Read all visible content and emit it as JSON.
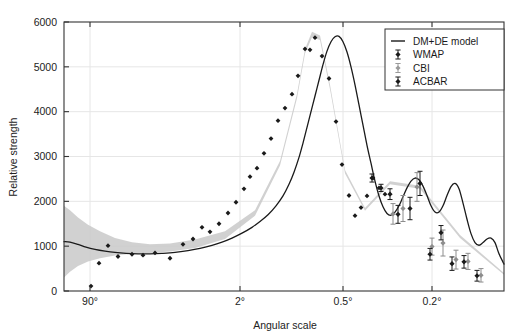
{
  "chart_data": {
    "type": "line",
    "title": "",
    "xlabel": "Angular scale",
    "ylabel": "Relative strength",
    "grid": true,
    "legend_position": "top-right",
    "ylim": [
      0,
      6000
    ],
    "yticks": [
      0,
      1000,
      2000,
      3000,
      4000,
      5000,
      6000
    ],
    "ytick_labels": [
      "0",
      "1000",
      "2000",
      "3000",
      "4000",
      "5000",
      "6000"
    ],
    "xtick_labels": [
      "90°",
      "2°",
      "0.5°",
      "0.2°"
    ],
    "xtick_positions_px": [
      90,
      240,
      343,
      432
    ],
    "x_axis_note": "multipole / inverse angular scale, non-linear",
    "legend": [
      {
        "label": "DM+DE model",
        "marker": "line",
        "color": "#1a1a1a"
      },
      {
        "label": "WMAP",
        "marker": "errorbar",
        "color": "#1a1a1a"
      },
      {
        "label": "CBI",
        "marker": "errorbar",
        "color": "#9a9a9a"
      },
      {
        "label": "ACBAR",
        "marker": "errorbar",
        "color": "#1a1a1a"
      }
    ],
    "band": {
      "name": "cosmic variance",
      "color": "#c9c9c9",
      "x": [
        64,
        70,
        78,
        88,
        100,
        115,
        132,
        150,
        170,
        195,
        225,
        255,
        280,
        297,
        305,
        312,
        320,
        330,
        345,
        365,
        390,
        420,
        460,
        504
      ],
      "upper": [
        1900,
        1800,
        1640,
        1480,
        1330,
        1180,
        1090,
        1045,
        1060,
        1150,
        1330,
        1800,
        2900,
        4400,
        5400,
        5780,
        5700,
        4600,
        2700,
        1850,
        2450,
        2350,
        1250,
        400
      ],
      "lower": [
        300,
        430,
        560,
        660,
        730,
        790,
        830,
        850,
        880,
        960,
        1160,
        1680,
        2800,
        4300,
        5300,
        5660,
        5600,
        4500,
        2620,
        1790,
        2380,
        2280,
        1180,
        360
      ]
    },
    "series": [
      {
        "name": "DM+DE model",
        "type": "line",
        "color": "#1a1a1a",
        "points": [
          [
            64,
            1100
          ],
          [
            70,
            1090
          ],
          [
            78,
            1040
          ],
          [
            86,
            980
          ],
          [
            95,
            930
          ],
          [
            105,
            890
          ],
          [
            115,
            860
          ],
          [
            126,
            840
          ],
          [
            138,
            830
          ],
          [
            150,
            830
          ],
          [
            162,
            840
          ],
          [
            175,
            860
          ],
          [
            188,
            900
          ],
          [
            200,
            950
          ],
          [
            212,
            1020
          ],
          [
            222,
            1090
          ],
          [
            232,
            1180
          ],
          [
            242,
            1290
          ],
          [
            252,
            1420
          ],
          [
            260,
            1550
          ],
          [
            268,
            1700
          ],
          [
            276,
            1900
          ],
          [
            283,
            2120
          ],
          [
            289,
            2380
          ],
          [
            294,
            2650
          ],
          [
            299,
            2980
          ],
          [
            303,
            3300
          ],
          [
            307,
            3650
          ],
          [
            311,
            4000
          ],
          [
            315,
            4350
          ],
          [
            319,
            4700
          ],
          [
            323,
            5050
          ],
          [
            327,
            5350
          ],
          [
            331,
            5560
          ],
          [
            335,
            5670
          ],
          [
            339,
            5680
          ],
          [
            343,
            5560
          ],
          [
            347,
            5330
          ],
          [
            351,
            5000
          ],
          [
            355,
            4600
          ],
          [
            359,
            4150
          ],
          [
            363,
            3700
          ],
          [
            367,
            3250
          ],
          [
            371,
            2850
          ],
          [
            375,
            2450
          ],
          [
            379,
            2120
          ],
          [
            383,
            1880
          ],
          [
            387,
            1730
          ],
          [
            391,
            1690
          ],
          [
            395,
            1760
          ],
          [
            399,
            1900
          ],
          [
            403,
            2100
          ],
          [
            407,
            2300
          ],
          [
            411,
            2450
          ],
          [
            415,
            2520
          ],
          [
            419,
            2480
          ],
          [
            423,
            2340
          ],
          [
            427,
            2130
          ],
          [
            431,
            1900
          ],
          [
            435,
            1760
          ],
          [
            439,
            1760
          ],
          [
            443,
            1900
          ],
          [
            447,
            2130
          ],
          [
            451,
            2330
          ],
          [
            455,
            2400
          ],
          [
            459,
            2280
          ],
          [
            463,
            1960
          ],
          [
            467,
            1600
          ],
          [
            471,
            1280
          ],
          [
            475,
            1080
          ],
          [
            479,
            1020
          ],
          [
            483,
            1080
          ],
          [
            487,
            1160
          ],
          [
            491,
            1180
          ],
          [
            495,
            1080
          ],
          [
            499,
            830
          ],
          [
            504,
            600
          ]
        ]
      },
      {
        "name": "WMAP",
        "type": "scatter",
        "color": "#1a1a1a",
        "marker": "diamond",
        "points": [
          [
            91,
            110
          ],
          [
            99,
            620
          ],
          [
            108,
            1010
          ],
          [
            118,
            770
          ],
          [
            132,
            820
          ],
          [
            143,
            800
          ],
          [
            155,
            850
          ],
          [
            170,
            730
          ],
          [
            183,
            1040
          ],
          [
            193,
            1160
          ],
          [
            202,
            1420
          ],
          [
            210,
            1320
          ],
          [
            219,
            1500
          ],
          [
            228,
            1740
          ],
          [
            236,
            1980
          ],
          [
            244,
            2280
          ],
          [
            250,
            2550
          ],
          [
            257,
            2740
          ],
          [
            264,
            3070
          ],
          [
            271,
            3400
          ],
          [
            278,
            3800
          ],
          [
            285,
            4080
          ],
          [
            292,
            4390
          ],
          [
            298,
            4800
          ],
          [
            305,
            5400
          ],
          [
            310,
            5380
          ],
          [
            315,
            5650
          ],
          [
            322,
            5240
          ],
          [
            329,
            4740
          ],
          [
            336,
            3780
          ],
          [
            342,
            2820
          ],
          [
            349,
            2130
          ],
          [
            355,
            1680
          ],
          [
            361,
            1860
          ],
          [
            367,
            2120
          ],
          [
            373,
            2520
          ],
          [
            379,
            2300
          ],
          [
            385,
            2160
          ]
        ]
      },
      {
        "name": "CBI",
        "type": "errorbar",
        "color": "#8d8d8d",
        "points": [
          [
            393,
            1720,
            230
          ],
          [
            403,
            1840,
            290
          ],
          [
            417,
            2320,
            320
          ],
          [
            432,
            990,
            190
          ],
          [
            443,
            1070,
            290
          ],
          [
            456,
            700,
            210
          ],
          [
            468,
            660,
            180
          ],
          [
            481,
            350,
            150
          ]
        ]
      },
      {
        "name": "ACBAR",
        "type": "errorbar",
        "color": "#1a1a1a",
        "points": [
          [
            372,
            2520,
            90
          ],
          [
            381,
            2300,
            80
          ],
          [
            390,
            2160,
            120
          ],
          [
            398,
            1710,
            200
          ],
          [
            410,
            1840,
            250
          ],
          [
            420,
            2400,
            270
          ],
          [
            430,
            820,
            130
          ],
          [
            441,
            1300,
            160
          ],
          [
            452,
            610,
            150
          ],
          [
            464,
            650,
            140
          ],
          [
            477,
            340,
            120
          ]
        ]
      }
    ],
    "peaks": [
      {
        "name": "first acoustic peak",
        "value": 5680
      },
      {
        "name": "first trough",
        "value": 1690
      },
      {
        "name": "second acoustic peak",
        "value": 2520
      },
      {
        "name": "second trough",
        "value": 1760
      },
      {
        "name": "third acoustic peak",
        "value": 2400
      },
      {
        "name": "fourth peak",
        "value": 1180
      }
    ]
  },
  "colors": {
    "frame": "#333333",
    "grid": "#e6e6e6",
    "band": "#c9c9c9",
    "curve": "#1a1a1a",
    "cbi": "#8d8d8d",
    "background": "#ffffff"
  }
}
